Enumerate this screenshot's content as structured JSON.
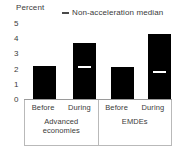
{
  "chart_data": {
    "type": "bar",
    "title": "",
    "subtitle": "",
    "xlabel": "",
    "ylabel": "Percent",
    "ylim": [
      0,
      5
    ],
    "yticks": [
      "0",
      "1",
      "2",
      "3",
      "4",
      "5"
    ],
    "grid": false,
    "legend_position": "top",
    "legend": [
      {
        "label": "Non-acceleration median",
        "marker": "dash",
        "color": "#4a4a4a"
      }
    ],
    "groups": [
      {
        "name": "Advanced economies",
        "name_lines": [
          "Advanced",
          "economies"
        ],
        "categories": [
          "Before",
          "During"
        ],
        "values": [
          2.2,
          3.7
        ],
        "median_markers": [
          null,
          2.1
        ]
      },
      {
        "name": "EMDEs",
        "name_lines": [
          "EMDEs"
        ],
        "categories": [
          "Before",
          "During"
        ],
        "values": [
          2.1,
          4.3
        ],
        "median_markers": [
          null,
          1.75
        ]
      }
    ],
    "categories": [
      "Before",
      "During",
      "Before",
      "During"
    ],
    "values": [
      2.2,
      3.7,
      2.1,
      4.3
    ],
    "series": [
      {
        "name": "Bar value",
        "values": [
          2.2,
          3.7,
          2.1,
          4.3
        ],
        "color": "#000000"
      },
      {
        "name": "Non-acceleration median",
        "values": [
          null,
          2.1,
          null,
          1.75
        ],
        "color": "#ffffff"
      }
    ],
    "bar_color": "#000000",
    "median_marker_color": "#ffffff",
    "axis_color": "#9a9a9a",
    "text_color": "#3a3a3a",
    "background": "#ffffff"
  }
}
